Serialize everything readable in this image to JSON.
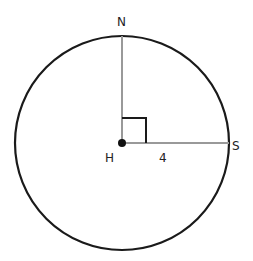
{
  "diagram": {
    "type": "circle-geometry",
    "labels": {
      "top_point": "N",
      "center_point": "H",
      "right_point": "S",
      "segment_length": "4"
    },
    "colors": {
      "circle": "#1a1a1a",
      "radii": "#999999",
      "right_angle_marker": "#1a1a1a",
      "center_dot": "#111111"
    }
  }
}
